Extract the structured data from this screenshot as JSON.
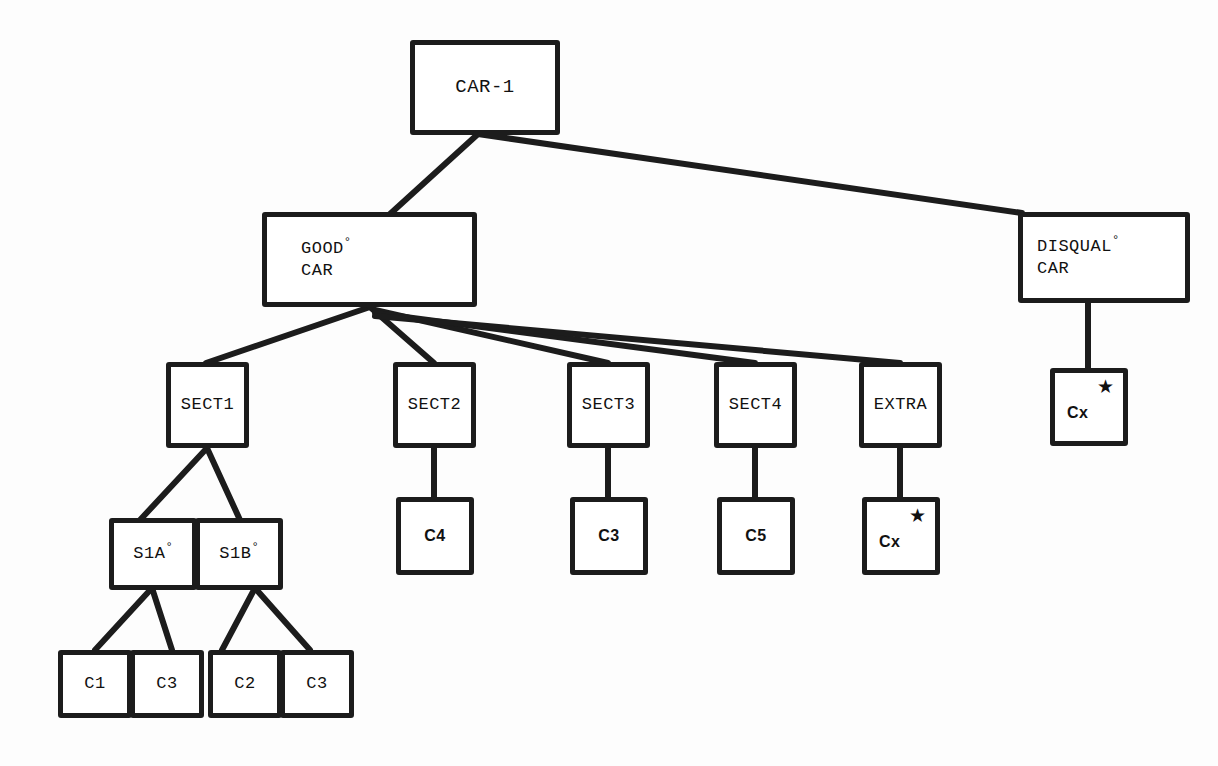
{
  "diagram": {
    "background_color": "#fdfdfd",
    "line_color": "#1c1c1c",
    "box_border_color": "#1c1c1c",
    "box_fill_color": "#ffffff"
  },
  "nodes": {
    "car1": {
      "label": "CAR-1",
      "sup": "",
      "mark": ""
    },
    "good": {
      "line1": "GOOD",
      "sup": "°",
      "line2": "CAR",
      "mark": ""
    },
    "disqual": {
      "line1": "DISQUAL",
      "sup": "°",
      "line2": "CAR",
      "mark": ""
    },
    "sect1": {
      "label": "SECT1",
      "sup": "",
      "mark": ""
    },
    "sect2": {
      "label": "SECT2",
      "sup": "",
      "mark": ""
    },
    "sect3": {
      "label": "SECT3",
      "sup": "",
      "mark": ""
    },
    "sect4": {
      "label": "SECT4",
      "sup": "",
      "mark": ""
    },
    "extra": {
      "label": "EXTRA",
      "sup": "",
      "mark": ""
    },
    "s1a": {
      "label": "S1A",
      "sup": "°",
      "mark": ""
    },
    "s1b": {
      "label": "S1B",
      "sup": "°",
      "mark": ""
    },
    "c1": {
      "label": "C1",
      "sup": "",
      "mark": ""
    },
    "c3a": {
      "label": "C3",
      "sup": "",
      "mark": ""
    },
    "c2": {
      "label": "C2",
      "sup": "",
      "mark": ""
    },
    "c3b": {
      "label": "C3",
      "sup": "",
      "mark": ""
    },
    "c4": {
      "label": "C4",
      "sup": "",
      "mark": ""
    },
    "c3c": {
      "label": "C3",
      "sup": "",
      "mark": ""
    },
    "c5": {
      "label": "C5",
      "sup": "",
      "mark": ""
    },
    "cx_extra": {
      "label": "Cx",
      "sup": "",
      "mark": "★"
    },
    "cx_disqual": {
      "label": "Cx",
      "sup": "",
      "mark": "★"
    }
  },
  "edges": [
    {
      "from": "car1",
      "to": "good"
    },
    {
      "from": "car1",
      "to": "disqual"
    },
    {
      "from": "good",
      "to": "sect1"
    },
    {
      "from": "good",
      "to": "sect2"
    },
    {
      "from": "good",
      "to": "sect3"
    },
    {
      "from": "good",
      "to": "sect4"
    },
    {
      "from": "good",
      "to": "extra"
    },
    {
      "from": "sect1",
      "to": "s1a"
    },
    {
      "from": "sect1",
      "to": "s1b"
    },
    {
      "from": "s1a",
      "to": "c1"
    },
    {
      "from": "s1a",
      "to": "c3a"
    },
    {
      "from": "s1b",
      "to": "c2"
    },
    {
      "from": "s1b",
      "to": "c3b"
    },
    {
      "from": "sect2",
      "to": "c4"
    },
    {
      "from": "sect3",
      "to": "c3c"
    },
    {
      "from": "sect4",
      "to": "c5"
    },
    {
      "from": "extra",
      "to": "cx_extra"
    },
    {
      "from": "disqual",
      "to": "cx_disqual"
    }
  ]
}
